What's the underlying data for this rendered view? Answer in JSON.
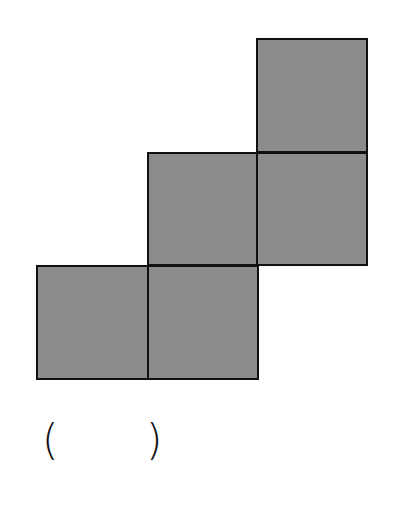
{
  "figure": {
    "fill_color": "#8c8c8c",
    "stroke_color": "#111111",
    "cells": [
      {
        "id": "top",
        "x": 256,
        "y": 38,
        "w": 112,
        "h": 115
      },
      {
        "id": "mid-left",
        "x": 147,
        "y": 152,
        "w": 111,
        "h": 114
      },
      {
        "id": "mid-right",
        "x": 256,
        "y": 152,
        "w": 112,
        "h": 114
      },
      {
        "id": "bottom-left",
        "x": 36,
        "y": 265,
        "w": 113,
        "h": 115
      },
      {
        "id": "bottom-right",
        "x": 147,
        "y": 265,
        "w": 112,
        "h": 115
      }
    ]
  },
  "answer": {
    "open_paren": "(",
    "close_paren": ")",
    "value": ""
  }
}
